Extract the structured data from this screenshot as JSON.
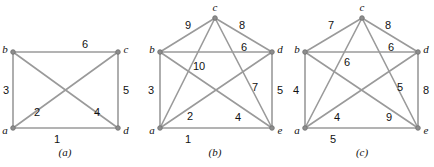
{
  "figure": {
    "width": 434,
    "height": 167,
    "background": "#ffffff",
    "edge_color": "#9a9a9a",
    "node_color": "#8d8d8d",
    "text_color": "#111111"
  },
  "panels": [
    {
      "id": "a",
      "caption": "(a)",
      "caption_pos": {
        "x": 65,
        "y": 152
      },
      "vertices": [
        {
          "id": "va",
          "label": "a",
          "x": 13,
          "y": 128,
          "label_x": 5,
          "label_y": 130
        },
        {
          "id": "vb",
          "label": "b",
          "x": 13,
          "y": 52,
          "label_x": 5,
          "label_y": 49
        },
        {
          "id": "vc",
          "label": "c",
          "x": 118,
          "y": 52,
          "label_x": 126,
          "label_y": 49
        },
        {
          "id": "vd",
          "label": "d",
          "x": 118,
          "y": 128,
          "label_x": 126,
          "label_y": 130
        }
      ],
      "edges": [
        {
          "from": "va",
          "to": "vd",
          "weight": "1",
          "label_x": 57,
          "label_y": 139
        },
        {
          "from": "va",
          "to": "vc",
          "weight": "2",
          "label_x": 37,
          "label_y": 112
        },
        {
          "from": "va",
          "to": "vb",
          "weight": "3",
          "label_x": 6,
          "label_y": 90
        },
        {
          "from": "vb",
          "to": "vd",
          "weight": "4",
          "label_x": 97,
          "label_y": 112
        },
        {
          "from": "vc",
          "to": "vd",
          "weight": "5",
          "label_x": 126,
          "label_y": 90
        },
        {
          "from": "vb",
          "to": "vc",
          "weight": "6",
          "label_x": 85,
          "label_y": 44
        }
      ]
    },
    {
      "id": "b",
      "caption": "(b)",
      "caption_pos": {
        "x": 215,
        "y": 152
      },
      "vertices": [
        {
          "id": "va",
          "label": "a",
          "x": 160,
          "y": 128,
          "label_x": 152,
          "label_y": 130
        },
        {
          "id": "vb",
          "label": "b",
          "x": 160,
          "y": 52,
          "label_x": 152,
          "label_y": 49
        },
        {
          "id": "vc",
          "label": "c",
          "x": 215,
          "y": 18,
          "label_x": 215,
          "label_y": 7
        },
        {
          "id": "vd",
          "label": "d",
          "x": 272,
          "y": 52,
          "label_x": 280,
          "label_y": 49
        },
        {
          "id": "ve",
          "label": "e",
          "x": 272,
          "y": 128,
          "label_x": 280,
          "label_y": 130
        }
      ],
      "edges": [
        {
          "from": "va",
          "to": "ve",
          "weight": "1",
          "label_x": 188,
          "label_y": 139
        },
        {
          "from": "va",
          "to": "vd",
          "weight": "2",
          "label_x": 190,
          "label_y": 116
        },
        {
          "from": "va",
          "to": "vb",
          "weight": "3",
          "label_x": 151,
          "label_y": 90
        },
        {
          "from": "vb",
          "to": "ve",
          "weight": "4",
          "label_x": 238,
          "label_y": 117
        },
        {
          "from": "vd",
          "to": "ve",
          "weight": "5",
          "label_x": 280,
          "label_y": 90
        },
        {
          "from": "vb",
          "to": "vd",
          "weight": "6",
          "label_x": 244,
          "label_y": 47
        },
        {
          "from": "vc",
          "to": "ve",
          "weight": "7",
          "label_x": 255,
          "label_y": 87
        },
        {
          "from": "vc",
          "to": "vd",
          "weight": "8",
          "label_x": 242,
          "label_y": 25
        },
        {
          "from": "vb",
          "to": "vc",
          "weight": "9",
          "label_x": 188,
          "label_y": 25
        },
        {
          "from": "va",
          "to": "vc",
          "weight": "10",
          "label_x": 199,
          "label_y": 66
        }
      ]
    },
    {
      "id": "c",
      "caption": "(c)",
      "caption_pos": {
        "x": 362,
        "y": 152
      },
      "vertices": [
        {
          "id": "va",
          "label": "a",
          "x": 305,
          "y": 128,
          "label_x": 297,
          "label_y": 130
        },
        {
          "id": "vb",
          "label": "b",
          "x": 305,
          "y": 52,
          "label_x": 297,
          "label_y": 49
        },
        {
          "id": "vc",
          "label": "c",
          "x": 362,
          "y": 18,
          "label_x": 362,
          "label_y": 7
        },
        {
          "id": "vd",
          "label": "d",
          "x": 418,
          "y": 52,
          "label_x": 426,
          "label_y": 49
        },
        {
          "id": "ve",
          "label": "e",
          "x": 418,
          "y": 128,
          "label_x": 426,
          "label_y": 130
        }
      ],
      "edges": [
        {
          "from": "va",
          "to": "ve",
          "weight": "5",
          "label_x": 333,
          "label_y": 139
        },
        {
          "from": "va",
          "to": "vd",
          "weight": "4",
          "label_x": 337,
          "label_y": 117
        },
        {
          "from": "va",
          "to": "vb",
          "weight": "4",
          "label_x": 296,
          "label_y": 90
        },
        {
          "from": "vb",
          "to": "ve",
          "weight": "9",
          "label_x": 389,
          "label_y": 117
        },
        {
          "from": "vd",
          "to": "ve",
          "weight": "8",
          "label_x": 426,
          "label_y": 90
        },
        {
          "from": "vb",
          "to": "vd",
          "weight": "6",
          "label_x": 391,
          "label_y": 47
        },
        {
          "from": "vc",
          "to": "ve",
          "weight": "5",
          "label_x": 400,
          "label_y": 87
        },
        {
          "from": "vc",
          "to": "vd",
          "weight": "8",
          "label_x": 388,
          "label_y": 25
        },
        {
          "from": "vb",
          "to": "vc",
          "weight": "7",
          "label_x": 331,
          "label_y": 25
        },
        {
          "from": "va",
          "to": "vc",
          "weight": "6",
          "label_x": 347,
          "label_y": 62
        }
      ]
    }
  ],
  "chart_data": {
    "type": "diagram",
    "title": "",
    "subtitle": "",
    "graphs": [
      {
        "name": "(a)",
        "vertices": [
          "a",
          "b",
          "c",
          "d"
        ],
        "edges": [
          {
            "u": "a",
            "v": "d",
            "w": 1
          },
          {
            "u": "a",
            "v": "c",
            "w": 2
          },
          {
            "u": "a",
            "v": "b",
            "w": 3
          },
          {
            "u": "b",
            "v": "d",
            "w": 4
          },
          {
            "u": "c",
            "v": "d",
            "w": 5
          },
          {
            "u": "b",
            "v": "c",
            "w": 6
          }
        ]
      },
      {
        "name": "(b)",
        "vertices": [
          "a",
          "b",
          "c",
          "d",
          "e"
        ],
        "edges": [
          {
            "u": "a",
            "v": "e",
            "w": 1
          },
          {
            "u": "a",
            "v": "d",
            "w": 2
          },
          {
            "u": "a",
            "v": "b",
            "w": 3
          },
          {
            "u": "b",
            "v": "e",
            "w": 4
          },
          {
            "u": "d",
            "v": "e",
            "w": 5
          },
          {
            "u": "b",
            "v": "d",
            "w": 6
          },
          {
            "u": "c",
            "v": "e",
            "w": 7
          },
          {
            "u": "c",
            "v": "d",
            "w": 8
          },
          {
            "u": "b",
            "v": "c",
            "w": 9
          },
          {
            "u": "a",
            "v": "c",
            "w": 10
          }
        ]
      },
      {
        "name": "(c)",
        "vertices": [
          "a",
          "b",
          "c",
          "d",
          "e"
        ],
        "edges": [
          {
            "u": "a",
            "v": "e",
            "w": 5
          },
          {
            "u": "a",
            "v": "d",
            "w": 4
          },
          {
            "u": "a",
            "v": "b",
            "w": 4
          },
          {
            "u": "b",
            "v": "e",
            "w": 9
          },
          {
            "u": "d",
            "v": "e",
            "w": 8
          },
          {
            "u": "b",
            "v": "d",
            "w": 6
          },
          {
            "u": "c",
            "v": "e",
            "w": 5
          },
          {
            "u": "c",
            "v": "d",
            "w": 8
          },
          {
            "u": "b",
            "v": "c",
            "w": 7
          },
          {
            "u": "a",
            "v": "c",
            "w": 6
          }
        ]
      }
    ]
  }
}
